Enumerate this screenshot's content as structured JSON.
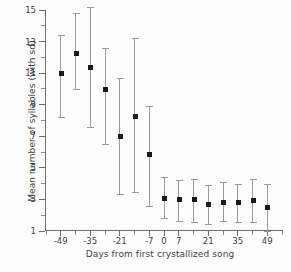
{
  "chart_data": {
    "type": "scatter",
    "title": "",
    "xlabel": "Days from first crystallized song",
    "ylabel": "Mean number of syllables (with sd)",
    "xlim": [
      -56,
      56
    ],
    "ylim": [
      1,
      15
    ],
    "grid": false,
    "legend": null,
    "error_bars": "sd",
    "x_tick_labels": [
      "-49",
      "-35",
      "-21",
      "-7",
      "0",
      "7",
      "21",
      "35",
      "49"
    ],
    "x_tick_values": [
      -49,
      -35,
      -21,
      -7,
      0,
      7,
      21,
      35,
      49
    ],
    "x_minor_ticks": [
      -56,
      -42,
      -28,
      -14,
      14,
      28,
      42,
      56
    ],
    "y_tick_labels": [
      "15",
      "13",
      "11",
      "9",
      "7",
      "5",
      "3",
      "1"
    ],
    "y_tick_values": [
      15,
      13,
      11,
      9,
      7,
      5,
      3,
      1
    ],
    "y_minor_ticks": [
      2,
      4,
      6,
      8,
      10,
      12,
      14
    ],
    "x": [
      -49,
      -42,
      -35,
      -28,
      -21,
      -14,
      -7,
      0,
      7,
      14,
      21,
      28,
      35,
      42,
      49
    ],
    "values": [
      11.0,
      12.3,
      11.4,
      10.0,
      7.0,
      8.3,
      5.9,
      3.1,
      3.0,
      3.05,
      2.7,
      2.85,
      2.85,
      2.95,
      2.5
    ],
    "sd_upper": [
      13.4,
      14.8,
      15.2,
      12.6,
      10.7,
      13.2,
      8.9,
      4.4,
      4.2,
      4.3,
      3.9,
      4.1,
      4.0,
      4.3,
      4.0
    ],
    "sd_lower": [
      8.2,
      10.0,
      7.6,
      6.5,
      3.35,
      3.5,
      2.6,
      1.85,
      1.65,
      1.6,
      1.45,
      1.65,
      1.6,
      1.6,
      1.0
    ]
  },
  "axes": {
    "xlabel": "Days from first crystallized song",
    "ylabel": "Mean number of syllables (with sd)"
  }
}
